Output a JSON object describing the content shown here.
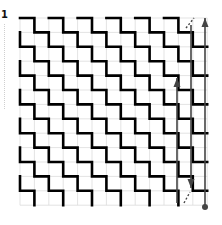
{
  "diagram": {
    "label": "1",
    "grid": {
      "origin_x": 20,
      "origin_y": 18,
      "cell": 14.4,
      "cols": 13,
      "rows": 13,
      "gridline_color": "#dcdcdc",
      "stroke_color": "#000000",
      "stroke_width": 2.6
    },
    "staircase_spacing_cells": 2,
    "annotations": {
      "color": "#444444",
      "arrows": [
        {
          "name": "long-up-arrow",
          "x": 205,
          "y_from": 207,
          "y_to": 18,
          "head": "up",
          "tail_dot": true
        },
        {
          "name": "down-arrow",
          "x": 191,
          "y_from": 25,
          "y_to": 188,
          "head": "down",
          "tail_dot": false
        },
        {
          "name": "short-up-arrow",
          "x": 177,
          "y_from": 203,
          "y_to": 78,
          "head": "up",
          "tail_dot": false
        }
      ],
      "dashed_segments": [
        {
          "x1": 186,
          "y1": 28,
          "x2": 194,
          "y2": 18
        },
        {
          "x1": 184,
          "y1": 203,
          "x2": 190,
          "y2": 192
        }
      ]
    }
  }
}
